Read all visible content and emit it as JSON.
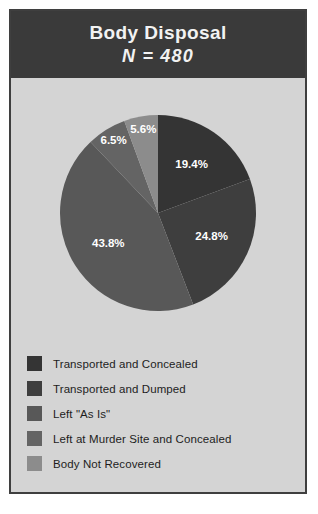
{
  "figure": {
    "header": {
      "title": "Body Disposal",
      "subtitle": "N = 480"
    },
    "background_color": "#d4d4d4",
    "header_color": "#3a3a3a",
    "border_color": "#3f3f3f",
    "label_text_color": "#ffffff"
  },
  "chart_data": {
    "type": "pie",
    "title": "Body Disposal",
    "subtitle": "N = 480",
    "total_n": 480,
    "units": "percent",
    "start_angle_deg": 0,
    "direction": "clockwise",
    "legend_position": "bottom",
    "grid": false,
    "categories": [
      "Transported and Concealed",
      "Transported and Dumped",
      "Left \"As Is\"",
      "Left at Murder Site and Concealed",
      "Body Not Recovered"
    ],
    "values": [
      19.4,
      24.8,
      43.8,
      6.5,
      5.6
    ],
    "data_labels": [
      "19.4%",
      "24.8%",
      "43.8%",
      "6.5%",
      "5.6%"
    ],
    "colors": [
      "#343434",
      "#3e3e3e",
      "#585858",
      "#646464",
      "#8c8c8c"
    ],
    "slices": [
      {
        "label": "Transported and Concealed",
        "value": 19.4,
        "data_label": "19.4%",
        "color": "#343434"
      },
      {
        "label": "Transported and Dumped",
        "value": 24.8,
        "data_label": "24.8%",
        "color": "#3e3e3e"
      },
      {
        "label": "Left \"As Is\"",
        "value": 43.8,
        "data_label": "43.8%",
        "color": "#585858"
      },
      {
        "label": "Left at Murder Site and Concealed",
        "value": 6.5,
        "data_label": "6.5%",
        "color": "#646464"
      },
      {
        "label": "Body Not Recovered",
        "value": 5.6,
        "data_label": "5.6%",
        "color": "#8c8c8c"
      }
    ]
  }
}
